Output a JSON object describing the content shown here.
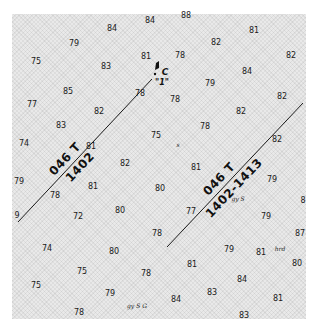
{
  "chart": {
    "soundings": [
      {
        "v": "84",
        "x": 150,
        "y": 21
      },
      {
        "v": "88",
        "x": 186,
        "y": 16
      },
      {
        "v": "84",
        "x": 112,
        "y": 29
      },
      {
        "v": "81",
        "x": 254,
        "y": 31
      },
      {
        "v": "79",
        "x": 74,
        "y": 44
      },
      {
        "v": "82",
        "x": 216,
        "y": 43
      },
      {
        "v": "75",
        "x": 36,
        "y": 62
      },
      {
        "v": "83",
        "x": 106,
        "y": 67
      },
      {
        "v": "81",
        "x": 146,
        "y": 57
      },
      {
        "v": "78",
        "x": 180,
        "y": 56
      },
      {
        "v": "82",
        "x": 291,
        "y": 56
      },
      {
        "v": "84",
        "x": 247,
        "y": 72
      },
      {
        "v": "79",
        "x": 210,
        "y": 84
      },
      {
        "v": "85",
        "x": 68,
        "y": 92
      },
      {
        "v": "78",
        "x": 140,
        "y": 94
      },
      {
        "v": "78",
        "x": 175,
        "y": 100
      },
      {
        "v": "82",
        "x": 282,
        "y": 97
      },
      {
        "v": "77",
        "x": 32,
        "y": 105
      },
      {
        "v": "82",
        "x": 99,
        "y": 112
      },
      {
        "v": "82",
        "x": 241,
        "y": 112
      },
      {
        "v": "83",
        "x": 61,
        "y": 126
      },
      {
        "v": "78",
        "x": 205,
        "y": 127
      },
      {
        "v": "75",
        "x": 156,
        "y": 136
      },
      {
        "v": "82",
        "x": 277,
        "y": 140
      },
      {
        "v": "74",
        "x": 24,
        "y": 144
      },
      {
        "v": "81",
        "x": 91,
        "y": 147
      },
      {
        "v": "82",
        "x": 125,
        "y": 164
      },
      {
        "v": "81",
        "x": 196,
        "y": 168
      },
      {
        "v": "79",
        "x": 19,
        "y": 182
      },
      {
        "v": "81",
        "x": 93,
        "y": 187
      },
      {
        "v": "80",
        "x": 160,
        "y": 189
      },
      {
        "v": "79",
        "x": 272,
        "y": 180
      },
      {
        "v": "8",
        "x": 303,
        "y": 201
      },
      {
        "v": "78",
        "x": 55,
        "y": 196
      },
      {
        "v": "9",
        "x": 17,
        "y": 216
      },
      {
        "v": "72",
        "x": 78,
        "y": 217
      },
      {
        "v": "80",
        "x": 120,
        "y": 211
      },
      {
        "v": "77",
        "x": 191,
        "y": 212
      },
      {
        "v": "79",
        "x": 266,
        "y": 217
      },
      {
        "v": "78",
        "x": 157,
        "y": 234
      },
      {
        "v": "87",
        "x": 300,
        "y": 234
      },
      {
        "v": "74",
        "x": 47,
        "y": 249
      },
      {
        "v": "80",
        "x": 114,
        "y": 252
      },
      {
        "v": "79",
        "x": 229,
        "y": 250
      },
      {
        "v": "81",
        "x": 261,
        "y": 253
      },
      {
        "v": "81",
        "x": 192,
        "y": 265
      },
      {
        "v": "80",
        "x": 297,
        "y": 264
      },
      {
        "v": "75",
        "x": 82,
        "y": 272
      },
      {
        "v": "78",
        "x": 146,
        "y": 274
      },
      {
        "v": "84",
        "x": 242,
        "y": 280
      },
      {
        "v": "75",
        "x": 36,
        "y": 286
      },
      {
        "v": "79",
        "x": 110,
        "y": 294
      },
      {
        "v": "83",
        "x": 212,
        "y": 293
      },
      {
        "v": "84",
        "x": 176,
        "y": 300
      },
      {
        "v": "81",
        "x": 278,
        "y": 299
      },
      {
        "v": "78",
        "x": 79,
        "y": 313
      },
      {
        "v": "83",
        "x": 244,
        "y": 316
      }
    ],
    "bottom_notes": [
      {
        "t": "s",
        "x": 178,
        "y": 144
      },
      {
        "t": "gy S",
        "x": 238,
        "y": 198
      },
      {
        "t": "hrd",
        "x": 280,
        "y": 248
      },
      {
        "t": "gy S G",
        "x": 137,
        "y": 305
      }
    ],
    "route_west": {
      "number": "1402",
      "bearing": "046 T",
      "x1": 152,
      "y1": 79,
      "x2": 18,
      "y2": 222
    },
    "route_east": {
      "number": "1402-1413",
      "bearing": "046 T",
      "x1": 303,
      "y1": 103,
      "x2": 167,
      "y2": 247
    },
    "buoy": {
      "letter": "C",
      "number": "\"1\"",
      "x": 158,
      "y": 70
    }
  }
}
